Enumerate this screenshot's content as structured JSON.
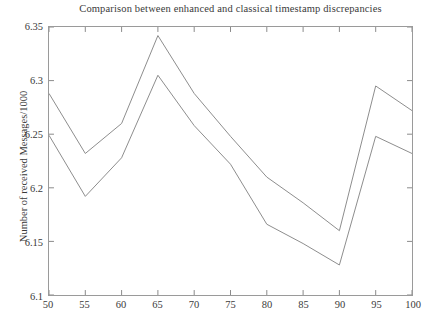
{
  "chart_data": {
    "type": "line",
    "title": "Comparison between enhanced and classical timestamp discrepancies",
    "xlabel": "",
    "ylabel": "Number of received Messages/1000",
    "x": [
      50,
      55,
      60,
      65,
      70,
      75,
      80,
      85,
      90,
      95,
      100
    ],
    "xlim": [
      50,
      100
    ],
    "ylim": [
      6.1,
      6.35
    ],
    "xticks": [
      "50",
      "55",
      "60",
      "65",
      "70",
      "75",
      "80",
      "85",
      "90",
      "95",
      "100"
    ],
    "yticks": [
      "6.1",
      "6.15",
      "6.2",
      "6.25",
      "6.3",
      "6.35"
    ],
    "grid": false,
    "legend": "none",
    "series": [
      {
        "name": "classical",
        "color": "#8c8c8c",
        "values": [
          6.288,
          6.232,
          6.26,
          6.342,
          6.288,
          6.248,
          6.21,
          6.186,
          6.16,
          6.295,
          6.272
        ]
      },
      {
        "name": "enhanced",
        "color": "#8c8c8c",
        "values": [
          6.249,
          6.192,
          6.228,
          6.305,
          6.258,
          6.222,
          6.166,
          6.148,
          6.128,
          6.248,
          6.232
        ]
      }
    ]
  },
  "axes": {
    "frame_color": "#9a9a9a",
    "tick_color": "#8a8a8a"
  }
}
